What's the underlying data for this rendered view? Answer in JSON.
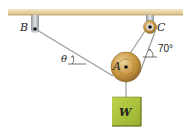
{
  "diagram": {
    "type": "statics-pulley-system",
    "labels": {
      "support_left": "B",
      "support_right": "C",
      "pulley_main": "A",
      "weight": "W",
      "angle_left": "θ",
      "angle_right": "70°"
    },
    "colors": {
      "ceiling": "#e8d5a8",
      "ceiling_edge": "#c9b07a",
      "pulley": "#c89a50",
      "pulley_dark": "#8a6428",
      "weight_fill": "#a8c23a",
      "weight_border": "#5e7018",
      "cable": "#9a9a9a",
      "support": "#b8bcc0"
    }
  }
}
